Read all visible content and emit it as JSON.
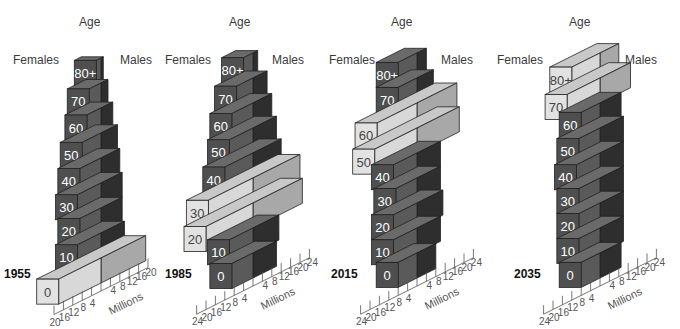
{
  "chart_data": [
    {
      "type": "bar",
      "subtype": "3d-population-pyramid",
      "title": "1955",
      "ylabel": "Age",
      "left_label": "Females",
      "right_label": "Males",
      "xlabel": "Millions",
      "x_ticks_left": [
        "20",
        "16",
        "12",
        "8",
        "4"
      ],
      "x_ticks_right": [
        "4",
        "8",
        "12",
        "16",
        "20"
      ],
      "xlim": [
        -20,
        20
      ],
      "categories": [
        "0",
        "10",
        "20",
        "30",
        "40",
        "50",
        "60",
        "70",
        "80+"
      ],
      "series": [
        {
          "name": "Females",
          "values": [
            18,
            10,
            9,
            10,
            9,
            8,
            6,
            5,
            2
          ]
        },
        {
          "name": "Males",
          "values": [
            19,
            10,
            9,
            9,
            8,
            7,
            5,
            3,
            1
          ]
        }
      ],
      "highlighted": [
        "0"
      ]
    },
    {
      "type": "bar",
      "subtype": "3d-population-pyramid",
      "title": "1985",
      "ylabel": "Age",
      "left_label": "Females",
      "right_label": "Males",
      "xlabel": "Millions",
      "x_ticks_left": [
        "24",
        "20",
        "16",
        "12",
        "8",
        "4"
      ],
      "x_ticks_right": [
        "4",
        "8",
        "12",
        "16",
        "20",
        "24"
      ],
      "xlim": [
        -24,
        24
      ],
      "categories": [
        "0",
        "10",
        "20",
        "30",
        "40",
        "50",
        "60",
        "70",
        "80+"
      ],
      "series": [
        {
          "name": "Females",
          "values": [
            9,
            10,
            20,
            19,
            12,
            10,
            9,
            7,
            4
          ]
        },
        {
          "name": "Males",
          "values": [
            10,
            11,
            21,
            20,
            12,
            10,
            8,
            6,
            2
          ]
        }
      ],
      "highlighted": [
        "20",
        "30"
      ]
    },
    {
      "type": "bar",
      "subtype": "3d-population-pyramid",
      "title": "2015",
      "ylabel": "Age",
      "left_label": "Females",
      "right_label": "Males",
      "xlabel": "Millions",
      "x_ticks_left": [
        "24",
        "20",
        "16",
        "12",
        "8",
        "4"
      ],
      "x_ticks_right": [
        "4",
        "8",
        "12",
        "16",
        "20",
        "24"
      ],
      "xlim": [
        -24,
        24
      ],
      "categories": [
        "0",
        "10",
        "20",
        "30",
        "40",
        "50",
        "60",
        "70",
        "80+"
      ],
      "series": [
        {
          "name": "Females",
          "values": [
            8,
            10,
            10,
            9,
            10,
            18,
            17,
            8,
            8
          ]
        },
        {
          "name": "Males",
          "values": [
            8,
            10,
            11,
            10,
            10,
            18,
            17,
            7,
            4
          ]
        }
      ],
      "highlighted": [
        "50",
        "60"
      ]
    },
    {
      "type": "bar",
      "subtype": "3d-population-pyramid",
      "title": "2035",
      "ylabel": "Age",
      "left_label": "Females",
      "right_label": "Males",
      "xlabel": "Millions",
      "x_ticks_left": [
        "24",
        "20",
        "16",
        "12",
        "8",
        "4"
      ],
      "x_ticks_right": [
        "4",
        "8",
        "12",
        "16",
        "20",
        "24"
      ],
      "xlim": [
        -24,
        24
      ],
      "categories": [
        "0",
        "10",
        "20",
        "30",
        "40",
        "50",
        "60",
        "70",
        "80+"
      ],
      "series": [
        {
          "name": "Females",
          "values": [
            8,
            9,
            9,
            9,
            10,
            9,
            8,
            14,
            12
          ]
        },
        {
          "name": "Males",
          "values": [
            9,
            10,
            10,
            10,
            10,
            10,
            9,
            13,
            8
          ]
        }
      ],
      "highlighted": [
        "70",
        "80+"
      ]
    }
  ],
  "colors": {
    "female_front": "#4f4f4f",
    "female_side": "#5a5a5a",
    "male_side": "#2e2e2e",
    "top": "#6a6a6a",
    "highlight_front": "#e2e2e2",
    "highlight_side_f": "#d8d8d8",
    "highlight_side_m": "#a8a8a8",
    "highlight_top": "#c8c8c8",
    "edge": "#222222"
  }
}
